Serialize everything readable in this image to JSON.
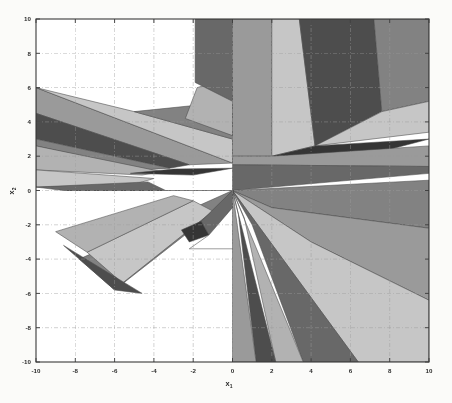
{
  "figure": {
    "type": "polyhedral-partition",
    "background_color": "#fbfbf9",
    "plot_background_color": "#ffffff",
    "frame_color": "#3a3a3a",
    "grid_color": "#9a9a9a",
    "grid_style": "dash-dot"
  },
  "axes": {
    "x": {
      "label": "x",
      "subscript": "1",
      "min": -10,
      "max": 10,
      "ticks": [
        -10,
        -8,
        -6,
        -4,
        -2,
        0,
        2,
        4,
        6,
        8,
        10
      ],
      "tick_labels": [
        "-10",
        "-8",
        "-6",
        "-4",
        "-2",
        "0",
        "2",
        "4",
        "6",
        "8",
        "10"
      ]
    },
    "y": {
      "label": "x",
      "subscript": "2",
      "min": -10,
      "max": 10,
      "ticks": [
        -10,
        -8,
        -6,
        -4,
        -2,
        0,
        2,
        4,
        6,
        8,
        10
      ],
      "tick_labels": [
        "-10",
        "-8",
        "-6",
        "-4",
        "-2",
        "0",
        "2",
        "4",
        "6",
        "8",
        "10"
      ]
    }
  },
  "chart_data": {
    "type": "area",
    "title": "",
    "xlabel": "x1",
    "ylabel": "x2",
    "xlim": [
      -10,
      10
    ],
    "ylim": [
      -10,
      10
    ],
    "grid": true,
    "legend": "none",
    "palette": {
      "white": "#ffffff",
      "very_light": "#dcdcdc",
      "light": "#c6c6c6",
      "light_mid": "#b2b2b2",
      "mid": "#9a9a9a",
      "mid_dark": "#828282",
      "dark": "#686868",
      "darker": "#4e4e4e",
      "darkest": "#343434"
    },
    "note": "Grayscale polyhedral critical-region partition radiating from the origin; regions are convex polygons in the (x1,x2) plane.",
    "regions": [
      {
        "id": 1,
        "fill": "#9a9a9a",
        "points": [
          [
            -10,
            6
          ],
          [
            -10,
            4.5
          ],
          [
            -2.2,
            1.5
          ],
          [
            0,
            1.6
          ]
        ]
      },
      {
        "id": 2,
        "fill": "#4e4e4e",
        "points": [
          [
            -10,
            4.5
          ],
          [
            -10,
            3.0
          ],
          [
            -3.2,
            1.3
          ],
          [
            -2.2,
            1.5
          ]
        ]
      },
      {
        "id": 3,
        "fill": "#c6c6c6",
        "points": [
          [
            -10,
            6
          ],
          [
            0,
            1.6
          ],
          [
            0,
            3.0
          ],
          [
            -5.0,
            4.6
          ]
        ]
      },
      {
        "id": 4,
        "fill": "#828282",
        "points": [
          [
            -10,
            3.0
          ],
          [
            -10,
            2.6
          ],
          [
            -4.5,
            1.2
          ],
          [
            -3.2,
            1.3
          ]
        ]
      },
      {
        "id": 5,
        "fill": "#b2b2b2",
        "points": [
          [
            -10,
            2.6
          ],
          [
            -10,
            1.2
          ],
          [
            -4.6,
            0.9
          ],
          [
            -3.6,
            1.1
          ]
        ]
      },
      {
        "id": 6,
        "fill": "#c6c6c6",
        "points": [
          [
            -10,
            1.2
          ],
          [
            -10,
            0.2
          ],
          [
            -5.2,
            0.3
          ],
          [
            -4.0,
            0.7
          ]
        ]
      },
      {
        "id": 7,
        "fill": "#686868",
        "points": [
          [
            -10,
            0.2
          ],
          [
            -8.6,
            0.0
          ],
          [
            -3.4,
            0.0
          ],
          [
            -4.3,
            0.5
          ]
        ]
      },
      {
        "id": 8,
        "fill": "#9a9a9a",
        "points": [
          [
            -8.6,
            0.0
          ],
          [
            -3.4,
            0.0
          ],
          [
            0,
            0
          ],
          [
            0,
            0
          ]
        ]
      },
      {
        "id": 9,
        "fill": "#343434",
        "points": [
          [
            -5.2,
            1.0
          ],
          [
            -2.0,
            0.9
          ],
          [
            0,
            1.3
          ],
          [
            -3.0,
            1.25
          ]
        ]
      },
      {
        "id": 10,
        "fill": "#828282",
        "points": [
          [
            -5.0,
            4.6
          ],
          [
            0,
            3.0
          ],
          [
            0,
            5.0
          ],
          [
            -1.6,
            5.0
          ]
        ]
      },
      {
        "id": 11,
        "fill": "#b2b2b2",
        "points": [
          [
            -2.4,
            4.2
          ],
          [
            0,
            3.2
          ],
          [
            0,
            6.6
          ],
          [
            -1.8,
            6.0
          ]
        ]
      },
      {
        "id": 12,
        "fill": "#686868",
        "points": [
          [
            -1.9,
            6.3
          ],
          [
            0,
            5.2
          ],
          [
            0,
            10
          ],
          [
            -1.9,
            10
          ]
        ]
      },
      {
        "id": 13,
        "fill": "#9a9a9a",
        "points": [
          [
            0,
            10
          ],
          [
            0,
            2.0
          ],
          [
            2.0,
            2.0
          ],
          [
            2.0,
            10
          ]
        ]
      },
      {
        "id": 14,
        "fill": "#c6c6c6",
        "points": [
          [
            2.0,
            10
          ],
          [
            2.0,
            2.0
          ],
          [
            4.2,
            2.6
          ],
          [
            3.4,
            10
          ]
        ]
      },
      {
        "id": 15,
        "fill": "#4e4e4e",
        "points": [
          [
            3.4,
            10
          ],
          [
            4.2,
            2.6
          ],
          [
            7.6,
            4.6
          ],
          [
            7.2,
            10
          ]
        ]
      },
      {
        "id": 16,
        "fill": "#828282",
        "points": [
          [
            7.2,
            10
          ],
          [
            7.6,
            4.6
          ],
          [
            10,
            5.2
          ],
          [
            10,
            10
          ]
        ]
      },
      {
        "id": 17,
        "fill": "#c6c6c6",
        "points": [
          [
            7.6,
            4.6
          ],
          [
            4.2,
            2.6
          ],
          [
            10,
            3.4
          ],
          [
            10,
            5.2
          ]
        ]
      },
      {
        "id": 18,
        "fill": "#343434",
        "points": [
          [
            4.2,
            2.6
          ],
          [
            2.0,
            2.0
          ],
          [
            6.0,
            1.8
          ],
          [
            10,
            3.0
          ]
        ]
      },
      {
        "id": 19,
        "fill": "#9a9a9a",
        "points": [
          [
            2.0,
            2.0
          ],
          [
            0,
            2.0
          ],
          [
            0,
            1.5
          ],
          [
            10,
            1.4
          ],
          [
            10,
            2.6
          ]
        ]
      },
      {
        "id": 20,
        "fill": "#686868",
        "points": [
          [
            0,
            1.5
          ],
          [
            0,
            0
          ],
          [
            10,
            1.0
          ],
          [
            10,
            1.4
          ]
        ]
      },
      {
        "id": 21,
        "fill": "#828282",
        "points": [
          [
            0,
            0
          ],
          [
            10,
            0.6
          ],
          [
            10,
            -2.2
          ],
          [
            2.0,
            -1.0
          ]
        ]
      },
      {
        "id": 22,
        "fill": "#9a9a9a",
        "points": [
          [
            0,
            0
          ],
          [
            2.0,
            -1.0
          ],
          [
            10,
            -2.2
          ],
          [
            10,
            -6.4
          ],
          [
            4.0,
            -3.0
          ]
        ]
      },
      {
        "id": 23,
        "fill": "#c6c6c6",
        "points": [
          [
            0,
            0
          ],
          [
            4.0,
            -3.0
          ],
          [
            10,
            -6.4
          ],
          [
            10,
            -10
          ],
          [
            6.4,
            -10
          ]
        ]
      },
      {
        "id": 24,
        "fill": "#686868",
        "points": [
          [
            0,
            0
          ],
          [
            6.4,
            -10
          ],
          [
            3.6,
            -10
          ],
          [
            1.0,
            -2.0
          ]
        ]
      },
      {
        "id": 25,
        "fill": "#b2b2b2",
        "points": [
          [
            0,
            0
          ],
          [
            3.6,
            -10
          ],
          [
            2.2,
            -10
          ],
          [
            0.6,
            -1.6
          ]
        ]
      },
      {
        "id": 26,
        "fill": "#4e4e4e",
        "points": [
          [
            0,
            0
          ],
          [
            2.2,
            -10
          ],
          [
            1.2,
            -10
          ],
          [
            0.3,
            -1.4
          ]
        ]
      },
      {
        "id": 27,
        "fill": "#9a9a9a",
        "points": [
          [
            0,
            0
          ],
          [
            1.2,
            -10
          ],
          [
            0,
            -10
          ],
          [
            0,
            -1.2
          ]
        ]
      },
      {
        "id": 28,
        "fill": "#828282",
        "points": [
          [
            0,
            0
          ],
          [
            -1.2,
            -1.5
          ],
          [
            -6.0,
            -5.8
          ],
          [
            -7.8,
            -4.0
          ]
        ]
      },
      {
        "id": 29,
        "fill": "#c6c6c6",
        "points": [
          [
            -1.0,
            -1.2
          ],
          [
            -5.6,
            -5.4
          ],
          [
            -7.4,
            -3.6
          ],
          [
            -2.0,
            -0.6
          ]
        ]
      },
      {
        "id": 30,
        "fill": "#4e4e4e",
        "points": [
          [
            -6.0,
            -5.8
          ],
          [
            -4.6,
            -6.0
          ],
          [
            -8.6,
            -3.2
          ],
          [
            -7.8,
            -4.0
          ]
        ]
      },
      {
        "id": 31,
        "fill": "#b2b2b2",
        "points": [
          [
            -2.0,
            -0.6
          ],
          [
            -7.4,
            -3.6
          ],
          [
            -9.0,
            -2.4
          ],
          [
            -3.0,
            -0.3
          ]
        ]
      },
      {
        "id": 32,
        "fill": "#686868",
        "points": [
          [
            0,
            0
          ],
          [
            -1.6,
            -1.8
          ],
          [
            -1.2,
            -2.6
          ],
          [
            0,
            -1.0
          ]
        ]
      },
      {
        "id": 33,
        "fill": "#343434",
        "points": [
          [
            -1.6,
            -1.8
          ],
          [
            -2.6,
            -2.3
          ],
          [
            -2.2,
            -3.0
          ],
          [
            -1.2,
            -2.6
          ]
        ]
      },
      {
        "id": 34,
        "fill": "#ffffff",
        "points": [
          [
            0,
            -1.0
          ],
          [
            -1.2,
            -2.6
          ],
          [
            -2.2,
            -3.4
          ],
          [
            0,
            -3.4
          ]
        ]
      }
    ]
  }
}
